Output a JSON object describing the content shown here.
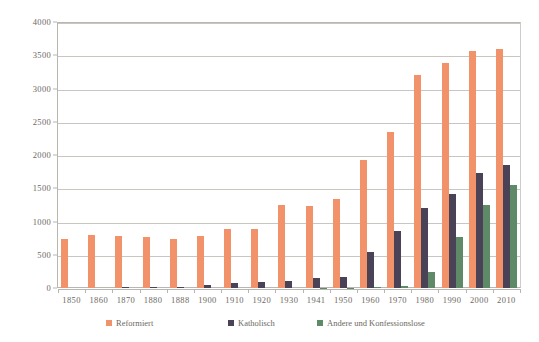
{
  "chart_data": {
    "type": "bar",
    "title": "",
    "subtitle": "",
    "xlabel": "",
    "ylabel": "",
    "ylim": [
      0,
      4000
    ],
    "ytick_step": 500,
    "yticks": [
      "0",
      "500",
      "1000",
      "1500",
      "2000",
      "2500",
      "3000",
      "3500",
      "4000"
    ],
    "grid": true,
    "legend_position": "bottom",
    "categories": [
      "1850",
      "1860",
      "1870",
      "1880",
      "1888",
      "1900",
      "1910",
      "1920",
      "1930",
      "1941",
      "1950",
      "1960",
      "1970",
      "1980",
      "1990",
      "2000",
      "2010"
    ],
    "series": [
      {
        "name": "Reformiert",
        "color": "#f2926a",
        "values": [
          740,
          790,
          780,
          770,
          730,
          775,
          885,
          890,
          1245,
          1240,
          1345,
          1925,
          2345,
          3210,
          3390,
          3570,
          3600
        ]
      },
      {
        "name": "Katholisch",
        "color": "#4a4256",
        "values": [
          0,
          0,
          10,
          8,
          15,
          45,
          80,
          85,
          110,
          150,
          170,
          545,
          855,
          1205,
          1410,
          1730,
          1845
        ]
      },
      {
        "name": "Andere und Konfessionslose",
        "color": "#5f8a68",
        "values": [
          0,
          0,
          0,
          0,
          0,
          0,
          0,
          0,
          0,
          5,
          5,
          8,
          30,
          235,
          760,
          1245,
          1555
        ]
      }
    ]
  },
  "legend": {
    "items": [
      {
        "label": "Reformiert",
        "color": "#f2926a"
      },
      {
        "label": "Katholisch",
        "color": "#4a4256"
      },
      {
        "label": "Andere und Konfessionslose",
        "color": "#5f8a68"
      }
    ]
  }
}
